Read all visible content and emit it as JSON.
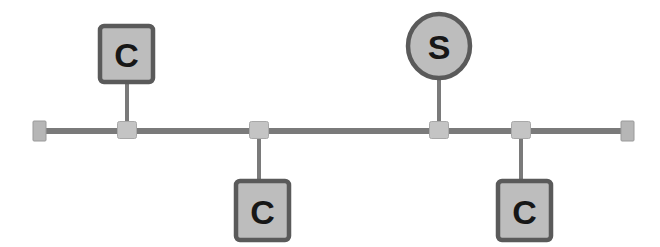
{
  "diagram": {
    "type": "network-topology-bus",
    "canvas": {
      "width": 660,
      "height": 247,
      "background": "#ffffff"
    },
    "colors": {
      "node_fill": "#bdbdbd",
      "node_stroke": "#5a5a5a",
      "bus_line": "#7a7a7a",
      "stem_line": "#7a7a7a",
      "tap_fill": "#c4c4c4",
      "tap_stroke": "#a8a8a8",
      "terminator_fill": "#b6b6b6",
      "terminator_stroke": "#9a9a9a",
      "label_text": "#171717"
    },
    "bus": {
      "name": "bus-backbone",
      "y": 131,
      "x_start": 40,
      "x_end": 628,
      "thickness": 6
    },
    "terminators": [
      {
        "id": "terminator-left",
        "name": "left-terminator",
        "x": 33,
        "y": 121,
        "width": 13,
        "height": 20
      },
      {
        "id": "terminator-right",
        "name": "right-terminator",
        "x": 621,
        "y": 121,
        "width": 13,
        "height": 20
      }
    ],
    "taps": [
      {
        "id": "tap-1",
        "name": "bus-tap-1",
        "cx": 127,
        "cy": 130,
        "width": 19,
        "height": 17,
        "attached_node": "node-c1"
      },
      {
        "id": "tap-2",
        "name": "bus-tap-2",
        "cx": 259,
        "cy": 130,
        "width": 19,
        "height": 17,
        "attached_node": "node-c2"
      },
      {
        "id": "tap-3",
        "name": "bus-tap-3",
        "cx": 439,
        "cy": 130,
        "width": 19,
        "height": 17,
        "attached_node": "node-s1"
      },
      {
        "id": "tap-4",
        "name": "bus-tap-4",
        "cx": 521,
        "cy": 130,
        "width": 19,
        "height": 17,
        "attached_node": "node-c3"
      }
    ],
    "nodes": [
      {
        "id": "node-c1",
        "name": "client-node-top-left",
        "label": "C",
        "role": "client",
        "shape": "rect",
        "x": 100,
        "y": 26,
        "width": 53,
        "height": 56,
        "font_size": 34,
        "position": "above-bus"
      },
      {
        "id": "node-c2",
        "name": "client-node-bottom-left",
        "label": "C",
        "role": "client",
        "shape": "rect",
        "x": 236,
        "y": 181,
        "width": 53,
        "height": 59,
        "font_size": 34,
        "position": "below-bus"
      },
      {
        "id": "node-s1",
        "name": "server-node",
        "label": "S",
        "role": "server",
        "shape": "ellipse",
        "cx": 439,
        "cy": 46,
        "rx": 31,
        "ry": 32,
        "font_size": 34,
        "position": "above-bus"
      },
      {
        "id": "node-c3",
        "name": "client-node-bottom-right",
        "label": "C",
        "role": "client",
        "shape": "rect",
        "x": 498,
        "y": 181,
        "width": 53,
        "height": 59,
        "font_size": 34,
        "position": "below-bus"
      }
    ],
    "stems": [
      {
        "id": "stem-c1",
        "name": "drop-line-client-1",
        "x": 127,
        "y1": 82,
        "y2": 131,
        "width": 4
      },
      {
        "id": "stem-c2",
        "name": "drop-line-client-2",
        "x": 259,
        "y1": 131,
        "y2": 181,
        "width": 4
      },
      {
        "id": "stem-s1",
        "name": "drop-line-server",
        "x": 439,
        "y1": 78,
        "y2": 131,
        "width": 4
      },
      {
        "id": "stem-c3",
        "name": "drop-line-client-3",
        "x": 521,
        "y1": 131,
        "y2": 181,
        "width": 4
      }
    ]
  }
}
